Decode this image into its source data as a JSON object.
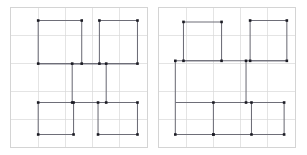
{
  "figure": {
    "panel_count": 2,
    "colors": {
      "background": "#ffffff",
      "grid": "#d9d9d9",
      "frame": "#d4d4d4",
      "loop_stroke": "#6e6e78",
      "vertex_fill": "#1c1c24"
    }
  },
  "chart_data": {
    "type": "scatter",
    "subtitle": "",
    "xlabel": "",
    "ylabel": "",
    "xlim": [
      0,
      5
    ],
    "ylim": [
      0,
      5
    ],
    "grid": true,
    "legend": "none",
    "grid_divisions": 5,
    "marker": "square",
    "panels": [
      {
        "name": "left-panel",
        "label": "",
        "loops": [
          {
            "name": "loop-upper-left",
            "closed": false,
            "points": [
              [
                1,
                4.55
              ],
              [
                1,
                3
              ],
              [
                2.6,
                3
              ],
              [
                2.6,
                4.55
              ],
              [
                1,
                4.55
              ]
            ],
            "vertices": [
              [
                1,
                4.55
              ],
              [
                2.6,
                4.55
              ],
              [
                1,
                3
              ],
              [
                2.6,
                3
              ]
            ]
          },
          {
            "name": "loop-upper-right",
            "closed": false,
            "points": [
              [
                3.25,
                4.55
              ],
              [
                3.25,
                3
              ],
              [
                4.65,
                3
              ],
              [
                4.65,
                4.55
              ],
              [
                3.25,
                4.55
              ]
            ],
            "vertices": [
              [
                3.25,
                4.55
              ],
              [
                4.65,
                4.55
              ],
              [
                3.25,
                3
              ],
              [
                4.65,
                3
              ]
            ]
          },
          {
            "name": "loop-center",
            "closed": false,
            "points": [
              [
                2.25,
                3
              ],
              [
                2.25,
                1.6
              ],
              [
                3.5,
                1.6
              ],
              [
                3.5,
                3
              ],
              [
                2.25,
                3
              ]
            ],
            "vertices": [
              [
                2.25,
                3
              ],
              [
                3.5,
                3
              ],
              [
                2.25,
                1.6
              ],
              [
                3.5,
                1.6
              ]
            ]
          },
          {
            "name": "loop-lower-left",
            "closed": false,
            "points": [
              [
                1,
                1.6
              ],
              [
                1,
                0.45
              ],
              [
                2.3,
                0.45
              ],
              [
                2.3,
                1.6
              ],
              [
                1,
                1.6
              ]
            ],
            "vertices": [
              [
                1,
                1.6
              ],
              [
                2.3,
                1.6
              ],
              [
                1,
                0.45
              ],
              [
                2.3,
                0.45
              ]
            ]
          },
          {
            "name": "loop-lower-right",
            "closed": false,
            "points": [
              [
                3.2,
                1.6
              ],
              [
                3.2,
                0.45
              ],
              [
                4.65,
                0.45
              ],
              [
                4.65,
                1.6
              ],
              [
                3.2,
                1.6
              ]
            ],
            "vertices": [
              [
                3.2,
                1.6
              ],
              [
                4.65,
                1.6
              ],
              [
                3.2,
                0.45
              ],
              [
                4.65,
                0.45
              ]
            ]
          },
          {
            "name": "connector-center-row",
            "closed": false,
            "points": [
              [
                1,
                3
              ],
              [
                4.65,
                3
              ]
            ],
            "vertices": []
          },
          {
            "name": "connector-lower-row",
            "closed": false,
            "points": [
              [
                1,
                1.6
              ],
              [
                4.65,
                1.6
              ]
            ],
            "vertices": []
          }
        ]
      },
      {
        "name": "right-panel",
        "label": "",
        "loops": [
          {
            "name": "loop-upper-left",
            "closed": false,
            "points": [
              [
                0.9,
                4.5
              ],
              [
                0.9,
                3.1
              ],
              [
                2.3,
                3.1
              ],
              [
                2.3,
                4.5
              ],
              [
                0.9,
                4.5
              ]
            ],
            "vertices": [
              [
                0.9,
                4.5
              ],
              [
                2.3,
                4.5
              ],
              [
                0.9,
                3.1
              ],
              [
                2.3,
                3.1
              ]
            ]
          },
          {
            "name": "loop-upper-right",
            "closed": false,
            "points": [
              [
                3.35,
                4.55
              ],
              [
                3.35,
                3.1
              ],
              [
                4.7,
                3.1
              ],
              [
                4.7,
                4.55
              ],
              [
                3.35,
                4.55
              ]
            ],
            "vertices": [
              [
                3.35,
                4.55
              ],
              [
                4.7,
                4.55
              ],
              [
                3.35,
                3.1
              ],
              [
                4.7,
                3.1
              ]
            ]
          },
          {
            "name": "loop-center",
            "closed": false,
            "points": [
              [
                3.2,
                3.1
              ],
              [
                3.2,
                1.6
              ],
              [
                2.0,
                1.6
              ],
              [
                2.0,
                0.45
              ],
              [
                3.4,
                0.45
              ]
            ],
            "vertices": [
              [
                3.2,
                3.1
              ],
              [
                3.2,
                1.6
              ],
              [
                2.0,
                1.6
              ],
              [
                2.0,
                0.45
              ]
            ]
          },
          {
            "name": "loop-lower-left",
            "closed": false,
            "points": [
              [
                0.6,
                3.1
              ],
              [
                0.6,
                0.45
              ],
              [
                2.0,
                0.45
              ]
            ],
            "vertices": [
              [
                0.6,
                3.1
              ],
              [
                0.6,
                0.45
              ],
              [
                2.0,
                0.45
              ]
            ]
          },
          {
            "name": "loop-lower-right",
            "closed": false,
            "points": [
              [
                3.4,
                1.6
              ],
              [
                4.6,
                1.6
              ],
              [
                4.6,
                0.45
              ],
              [
                3.4,
                0.45
              ],
              [
                3.4,
                1.6
              ]
            ],
            "vertices": [
              [
                3.4,
                1.6
              ],
              [
                4.6,
                1.6
              ],
              [
                4.6,
                0.45
              ],
              [
                3.4,
                0.45
              ]
            ]
          },
          {
            "name": "connector-upper-row",
            "closed": false,
            "points": [
              [
                0.6,
                3.1
              ],
              [
                4.7,
                3.1
              ]
            ],
            "vertices": []
          },
          {
            "name": "connector-lower-row",
            "closed": false,
            "points": [
              [
                0.6,
                1.6
              ],
              [
                4.6,
                1.6
              ]
            ],
            "vertices": []
          }
        ]
      }
    ]
  }
}
